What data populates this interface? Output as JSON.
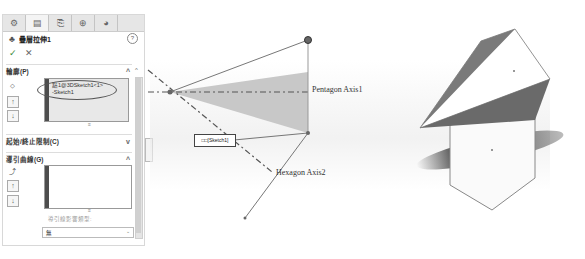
{
  "panel": {
    "tabs": [
      {
        "icon": "feature-manager-icon",
        "glyph": "⚙"
      },
      {
        "icon": "property-manager-icon",
        "glyph": "▤"
      },
      {
        "icon": "configuration-manager-icon",
        "glyph": "⎘"
      },
      {
        "icon": "dimxpert-icon",
        "glyph": "⊕"
      },
      {
        "icon": "display-manager-icon",
        "glyph": "◕"
      }
    ],
    "title": "疊層拉伸1",
    "help_glyph": "?",
    "ok_glyph": "✓",
    "cancel_glyph": "✕",
    "profiles": {
      "header": "輪廓(P)",
      "chevron": "^",
      "items": [
        "點1@3DSketch1<1>",
        "-Sketch1"
      ]
    },
    "start_end": {
      "header": "起始/終止限制(C)",
      "chevron": "v"
    },
    "guide_curves": {
      "header": "導引曲線(G)",
      "chevron": "^",
      "influence_label": "導引線影響類型:",
      "influence_value": "無"
    }
  },
  "viewport": {
    "labels": {
      "pentagon_axis": "Pentagon Axis1",
      "hexagon_axis": "Hexagon Axis2",
      "callout": "□□[Sketch1]"
    }
  }
}
